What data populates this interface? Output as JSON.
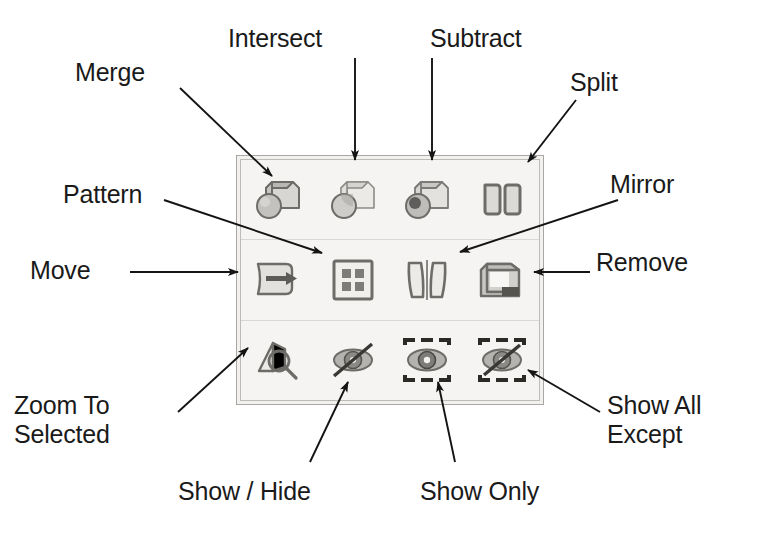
{
  "figure": {
    "background_color": "#ffffff",
    "text_color": "#1a1a1a",
    "panel_background": "#f5f4f2",
    "panel_border_color": "#a9a7a3",
    "icon_fill": "#c9c7c3",
    "icon_stroke": "#6e6c68"
  },
  "toolbar": {
    "rows": [
      {
        "row_index": 0,
        "buttons": [
          {
            "name": "merge",
            "label": "Merge",
            "icon": "merge-icon"
          },
          {
            "name": "intersect",
            "label": "Intersect",
            "icon": "intersect-icon"
          },
          {
            "name": "subtract",
            "label": "Subtract",
            "icon": "subtract-icon"
          },
          {
            "name": "split",
            "label": "Split",
            "icon": "split-icon"
          }
        ]
      },
      {
        "row_index": 1,
        "buttons": [
          {
            "name": "move",
            "label": "Move",
            "icon": "move-icon"
          },
          {
            "name": "pattern",
            "label": "Pattern",
            "icon": "pattern-icon"
          },
          {
            "name": "mirror",
            "label": "Mirror",
            "icon": "mirror-icon"
          },
          {
            "name": "remove",
            "label": "Remove",
            "icon": "remove-icon"
          }
        ]
      },
      {
        "row_index": 2,
        "buttons": [
          {
            "name": "zoom-to-selected",
            "label": "Zoom To Selected",
            "icon": "zoom-to-selected-icon"
          },
          {
            "name": "show-hide",
            "label": "Show / Hide",
            "icon": "show-hide-eye-icon"
          },
          {
            "name": "show-only",
            "label": "Show Only",
            "icon": "show-only-eye-icon"
          },
          {
            "name": "show-all-except",
            "label": "Show All Except",
            "icon": "show-all-except-eye-icon"
          }
        ]
      }
    ]
  },
  "callouts": [
    {
      "id": "merge",
      "text": "Merge",
      "x": 75,
      "y": 58,
      "align": "left"
    },
    {
      "id": "intersect",
      "text": "Intersect",
      "x": 228,
      "y": 24,
      "align": "left"
    },
    {
      "id": "subtract",
      "text": "Subtract",
      "x": 430,
      "y": 24,
      "align": "left"
    },
    {
      "id": "split",
      "text": "Split",
      "x": 570,
      "y": 68,
      "align": "left"
    },
    {
      "id": "pattern",
      "text": "Pattern",
      "x": 63,
      "y": 180,
      "align": "left"
    },
    {
      "id": "mirror",
      "text": "Mirror",
      "x": 610,
      "y": 170,
      "align": "left"
    },
    {
      "id": "move",
      "text": "Move",
      "x": 30,
      "y": 263,
      "align": "left"
    },
    {
      "id": "remove",
      "text": "Remove",
      "x": 596,
      "y": 248,
      "align": "left"
    },
    {
      "id": "zoom-to-selected",
      "text": "Zoom To\nSelected",
      "x": 14,
      "y": 391,
      "align": "left"
    },
    {
      "id": "show-all-except",
      "text": "Show All\nExcept",
      "x": 607,
      "y": 391,
      "align": "left"
    },
    {
      "id": "show-hide",
      "text": "Show / Hide",
      "x": 178,
      "y": 477,
      "align": "left"
    },
    {
      "id": "show-only",
      "text": "Show Only",
      "x": 420,
      "y": 477,
      "align": "left"
    }
  ],
  "leader_lines": [
    {
      "id": "merge-leader",
      "x1": 180,
      "y1": 88,
      "x2": 272,
      "y2": 176,
      "arrow": true
    },
    {
      "id": "intersect-leader",
      "x1": 355,
      "y1": 58,
      "x2": 355,
      "y2": 160,
      "arrow": true
    },
    {
      "id": "subtract-leader",
      "x1": 432,
      "y1": 58,
      "x2": 432,
      "y2": 160,
      "arrow": true
    },
    {
      "id": "split-leader",
      "x1": 576,
      "y1": 100,
      "x2": 528,
      "y2": 162,
      "arrow": true
    },
    {
      "id": "pattern-leader",
      "x1": 164,
      "y1": 200,
      "x2": 322,
      "y2": 253,
      "arrow": true
    },
    {
      "id": "mirror-leader",
      "x1": 618,
      "y1": 200,
      "x2": 460,
      "y2": 252,
      "arrow": true
    },
    {
      "id": "move-leader",
      "x1": 130,
      "y1": 272,
      "x2": 238,
      "y2": 272,
      "arrow": true
    },
    {
      "id": "remove-leader",
      "x1": 590,
      "y1": 272,
      "x2": 534,
      "y2": 272,
      "arrow": true
    },
    {
      "id": "zoom-to-selected-leader",
      "x1": 178,
      "y1": 412,
      "x2": 248,
      "y2": 348,
      "arrow": true
    },
    {
      "id": "show-all-except-leader",
      "x1": 600,
      "y1": 412,
      "x2": 528,
      "y2": 370,
      "arrow": true
    },
    {
      "id": "show-hide-leader",
      "x1": 310,
      "y1": 462,
      "x2": 348,
      "y2": 382,
      "arrow": true
    },
    {
      "id": "show-only-leader",
      "x1": 455,
      "y1": 462,
      "x2": 438,
      "y2": 382,
      "arrow": true
    }
  ]
}
